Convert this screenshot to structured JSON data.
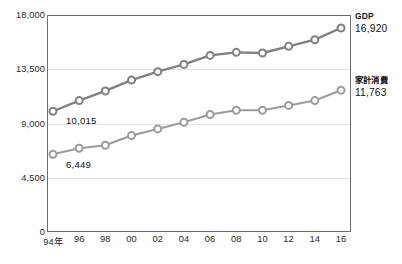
{
  "chart_data": {
    "type": "line",
    "title": "",
    "subtitle": "",
    "xlabel": "",
    "ylabel": "",
    "x": [
      "94年",
      "96",
      "98",
      "00",
      "02",
      "04",
      "06",
      "08",
      "10",
      "12",
      "14",
      "16"
    ],
    "categories": [
      "94年",
      "96",
      "98",
      "00",
      "02",
      "04",
      "06",
      "08",
      "10",
      "12",
      "14",
      "16"
    ],
    "ylim": [
      0,
      18000
    ],
    "yticks": [
      0,
      4500,
      9000,
      13500,
      18000
    ],
    "ytick_labels": [
      "0",
      "4,500",
      "9,000",
      "13,500",
      "18,000"
    ],
    "grid": true,
    "legend_position": "right-inline",
    "series": [
      {
        "name": "GDP",
        "color": "#808080",
        "end_label": "16,920",
        "start_label": "10,015",
        "values": [
          10015,
          10900,
          11700,
          12600,
          13300,
          13900,
          14650,
          14900,
          14850,
          15400,
          15950,
          16920
        ]
      },
      {
        "name": "家計消費",
        "color": "#9b9b9b",
        "end_label": "11,763",
        "start_label": "6,449",
        "values": [
          6449,
          6950,
          7200,
          8000,
          8550,
          9100,
          9750,
          10100,
          10100,
          10500,
          10900,
          11763
        ]
      }
    ],
    "annotations": [
      {
        "text": "10,015",
        "series": "GDP",
        "at": "94年"
      },
      {
        "text": "6,449",
        "series": "家計消費",
        "at": "94年"
      }
    ]
  },
  "colors": {
    "gdp_line": "#808080",
    "consumption_line": "#9b9b9b",
    "axis": "#6e6e6e",
    "grid": "#e2e2e2",
    "text": "#1f1f1f",
    "background": "#ffffff"
  }
}
